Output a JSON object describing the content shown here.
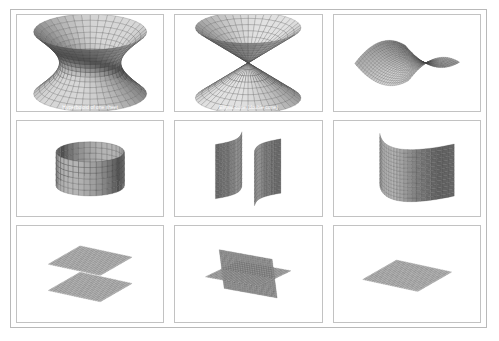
{
  "figure": {
    "layout": {
      "rows": 3,
      "columns": 3,
      "total_panels": 9
    },
    "background_color": "#ffffff",
    "frame_color": "#b9b9b9",
    "mesh_color": "#3a3a3a",
    "fill_light": "#d9d9d9",
    "fill_dark": "#7a7a7a"
  },
  "panels": [
    {
      "index": 1,
      "row": 1,
      "column": 1,
      "name": "hyperboloid-of-one-sheet",
      "label": "Hyperboloid of one sheet",
      "render": "wireframe-shaded",
      "orientation": "vertical axis"
    },
    {
      "index": 2,
      "row": 1,
      "column": 2,
      "name": "double-cone",
      "label": "Elliptic cone (double cone)",
      "render": "wireframe-shaded",
      "orientation": "vertical axis, apex at center"
    },
    {
      "index": 3,
      "row": 1,
      "column": 3,
      "name": "hyperbolic-paraboloid",
      "label": "Hyperbolic paraboloid (saddle)",
      "render": "wireframe-shaded",
      "orientation": "tilted, opening right"
    },
    {
      "index": 4,
      "row": 2,
      "column": 1,
      "name": "elliptic-cylinder",
      "label": "Elliptic cylinder",
      "render": "wireframe-shaded",
      "orientation": "vertical axis"
    },
    {
      "index": 5,
      "row": 2,
      "column": 2,
      "name": "hyperbolic-cylinder",
      "label": "Hyperbolic cylinder (two sheets)",
      "render": "wireframe-shaded",
      "orientation": "two opposing curved sheets"
    },
    {
      "index": 6,
      "row": 2,
      "column": 3,
      "name": "parabolic-cylinder",
      "label": "Parabolic cylinder",
      "render": "wireframe-shaded",
      "orientation": "curved sheet folding back"
    },
    {
      "index": 7,
      "row": 3,
      "column": 1,
      "name": "parallel-planes",
      "label": "Two parallel planes",
      "render": "wireframe-shaded",
      "orientation": "stacked horizontal planes"
    },
    {
      "index": 8,
      "row": 3,
      "column": 2,
      "name": "intersecting-planes",
      "label": "Two intersecting planes",
      "render": "wireframe-shaded",
      "orientation": "crossed planes"
    },
    {
      "index": 9,
      "row": 3,
      "column": 3,
      "name": "single-plane",
      "label": "Single plane",
      "render": "wireframe-shaded",
      "orientation": "horizontal plane"
    }
  ]
}
